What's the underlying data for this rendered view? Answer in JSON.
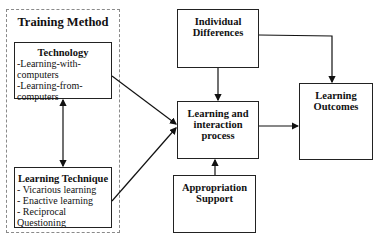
{
  "diagram": {
    "group": {
      "title": "Training Method"
    },
    "nodes": {
      "technology": {
        "title": "Technology",
        "items": [
          "-Learning-with-",
          "computers",
          "-Learning-from-",
          "computers"
        ]
      },
      "learning_technique": {
        "title": "Learning Technique",
        "items": [
          "- Vicarious learning",
          "- Enactive learning",
          "- Reciprocal",
          "Questioning"
        ]
      },
      "individual_differences": {
        "title_line1": "Individual",
        "title_line2": "Differences"
      },
      "learning_interaction": {
        "title_line1": "Learning and",
        "title_line2": "interaction",
        "title_line3": "process"
      },
      "appropriation_support": {
        "title_line1": "Appropriation",
        "title_line2": "Support"
      },
      "learning_outcomes": {
        "title_line1": "Learning",
        "title_line2": "Outcomes"
      }
    },
    "edges": [
      {
        "from": "technology",
        "to": "learning_technique",
        "type": "bidirectional"
      },
      {
        "from": "technology",
        "to": "learning_interaction"
      },
      {
        "from": "learning_technique",
        "to": "learning_interaction"
      },
      {
        "from": "individual_differences",
        "to": "learning_interaction"
      },
      {
        "from": "individual_differences",
        "to": "learning_outcomes"
      },
      {
        "from": "appropriation_support",
        "to": "learning_interaction"
      },
      {
        "from": "learning_interaction",
        "to": "learning_outcomes"
      }
    ]
  }
}
